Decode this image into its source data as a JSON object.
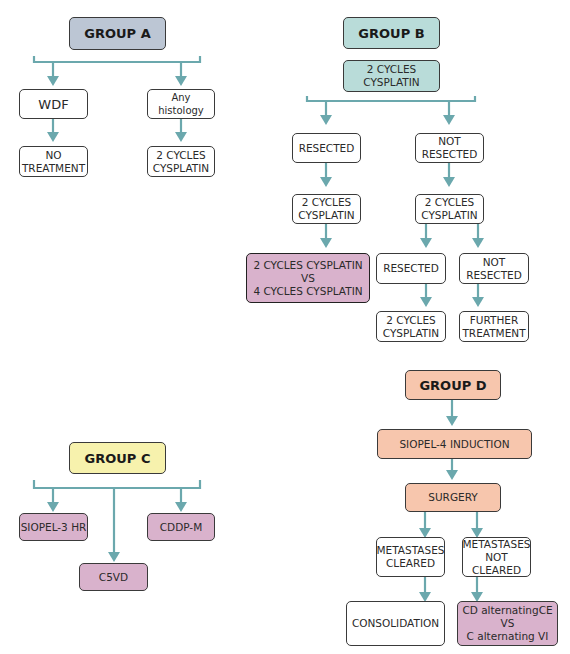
{
  "colors": {
    "connector": "#6ba8ad",
    "group_a": "#bcc6d4",
    "group_b": "#b9dcd9",
    "group_c": "#f7f2ad",
    "group_d": "#f7c6ad",
    "trial_arm": "#d9b2cc"
  },
  "group_a": {
    "title": "GROUP A",
    "wdf": "WDF",
    "any_histology": "Any histology",
    "no_treatment": "NO\nTREATMENT",
    "cycles": "2 CYCLES\nCYSPLATIN"
  },
  "group_b": {
    "title": "GROUP B",
    "initial": "2 CYCLES\nCYSPLATIN",
    "resected": "RESECTED",
    "not_resected": "NOT\nRESECTED",
    "resected_cycles": "2 CYCLES\nCYSPLATIN",
    "not_resected_cycles": "2 CYCLES\nCYSPLATIN",
    "randomization": "2 CYCLES CYSPLATIN\nVS\n4 CYCLES CYSPLATIN",
    "second_resected": "RESECTED",
    "second_not_resected": "NOT\nRESECTED",
    "second_resected_cycles": "2 CYCLES\nCYSPLATIN",
    "further_treatment": "FURTHER\nTREATMENT"
  },
  "group_c": {
    "title": "GROUP C",
    "siopel3": "SIOPEL-3 HR",
    "c5vd": "C5VD",
    "cddp": "CDDP-M"
  },
  "group_d": {
    "title": "GROUP D",
    "induction": "SIOPEL-4 INDUCTION",
    "surgery": "SURGERY",
    "cleared": "METASTASES\nCLEARED",
    "not_cleared": "METASTASES\nNOT\nCLEARED",
    "consolidation": "CONSOLIDATION",
    "randomization": "CD alternatingCE\nVS\nC alternating VI"
  }
}
